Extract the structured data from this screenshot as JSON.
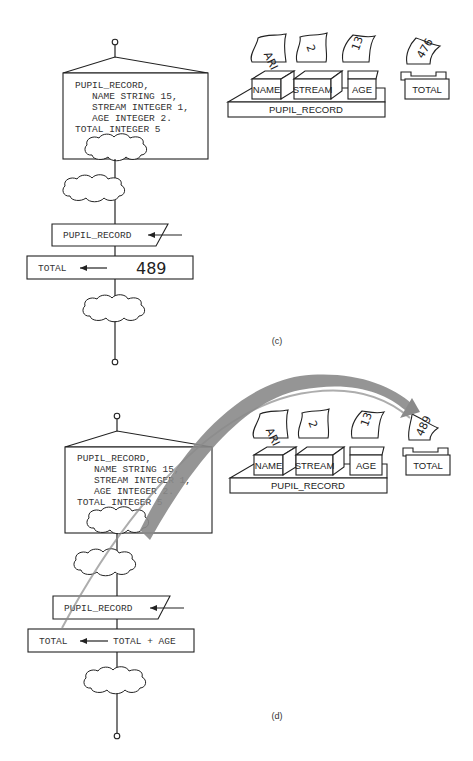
{
  "panels": [
    {
      "id": "c",
      "caption": "(c)",
      "flowchart": {
        "declaration_lines": [
          "PUPIL_RECORD,",
          "   NAME STRING 15,",
          "   STREAM INTEGER 1,",
          "   AGE INTEGER 2.",
          "TOTAL INTEGER 5"
        ],
        "input_box_label": "PUPIL_RECORD",
        "assign_target": "TOTAL",
        "assign_value": "489"
      },
      "memory": {
        "record_label": "PUPIL_RECORD",
        "fields": [
          {
            "name": "NAME",
            "value": "ARI"
          },
          {
            "name": "STREAM",
            "value": "2"
          },
          {
            "name": "AGE",
            "value": "13"
          }
        ],
        "total": {
          "name": "TOTAL",
          "value": "476"
        }
      }
    },
    {
      "id": "d",
      "caption": "(d)",
      "flowchart": {
        "declaration_lines": [
          "PUPIL_RECORD,",
          "   NAME STRING 15,",
          "   STREAM INTEGER 1,",
          "   AGE INTEGER 2.",
          "TOTAL INTEGER 5"
        ],
        "input_box_label": "PUPIL_RECORD",
        "assign_target": "TOTAL",
        "assign_value": "TOTAL + AGE"
      },
      "memory": {
        "record_label": "PUPIL_RECORD",
        "fields": [
          {
            "name": "NAME",
            "value": "ARI"
          },
          {
            "name": "STREAM",
            "value": "2"
          },
          {
            "name": "AGE",
            "value": "13"
          }
        ],
        "total": {
          "name": "TOTAL",
          "value": "489"
        }
      },
      "arrow_color": "#8a8a8a"
    }
  ]
}
